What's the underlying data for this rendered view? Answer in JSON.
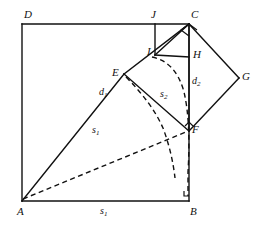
{
  "figure": {
    "kind": "geometry-diagram",
    "width": 262,
    "height": 229,
    "background_color": "#ffffff",
    "stroke_color": "#111111"
  },
  "vertices": [
    {
      "id": "D",
      "label": "D",
      "x": 22,
      "y": 24,
      "label_x": 24,
      "label_y": 9
    },
    {
      "id": "J",
      "label": "J",
      "x": 155,
      "y": 24,
      "label_x": 151,
      "label_y": 9
    },
    {
      "id": "C",
      "label": "C",
      "x": 189,
      "y": 24,
      "label_x": 191,
      "label_y": 9
    },
    {
      "id": "I",
      "label": "I",
      "x": 155,
      "y": 55,
      "label_x": 147,
      "label_y": 46
    },
    {
      "id": "H",
      "label": "H",
      "x": 189,
      "y": 57,
      "label_x": 193,
      "label_y": 49
    },
    {
      "id": "G",
      "label": "G",
      "x": 239,
      "y": 78,
      "label_x": 242,
      "label_y": 71
    },
    {
      "id": "E",
      "label": "E",
      "x": 124,
      "y": 74,
      "label_x": 112,
      "label_y": 67
    },
    {
      "id": "F",
      "label": "F",
      "x": 189,
      "y": 131,
      "label_x": 192,
      "label_y": 124
    },
    {
      "id": "A",
      "label": "A",
      "x": 22,
      "y": 201,
      "label_x": 17,
      "label_y": 206
    },
    {
      "id": "B",
      "label": "B",
      "x": 189,
      "y": 201,
      "label_x": 190,
      "label_y": 206
    }
  ],
  "measures": [
    {
      "id": "d1",
      "base": "d",
      "sub": "1",
      "x": 99,
      "y": 87,
      "meaning": "diagonal-of-large-square"
    },
    {
      "id": "s1_diag",
      "base": "s",
      "sub": "1",
      "x": 92,
      "y": 125,
      "meaning": "side-of-large-square"
    },
    {
      "id": "s2",
      "base": "s",
      "sub": "2",
      "x": 160,
      "y": 89,
      "meaning": "side-of-small-square"
    },
    {
      "id": "d2",
      "base": "d",
      "sub": "2",
      "x": 192,
      "y": 76,
      "meaning": "diagonal-of-small-square"
    },
    {
      "id": "s1_bottom",
      "base": "s",
      "sub": "1",
      "x": 100,
      "y": 206,
      "meaning": "bottom-side-of-large-square"
    }
  ],
  "solid_edges": [
    {
      "name": "edge-D-C",
      "from": "D",
      "to": "C"
    },
    {
      "name": "edge-D-A",
      "from": "D",
      "to": "A"
    },
    {
      "name": "edge-A-B",
      "from": "A",
      "to": "B"
    },
    {
      "name": "edge-B-C",
      "from": "B",
      "to": "C"
    },
    {
      "name": "edge-A-E",
      "from": "A",
      "to": "E"
    },
    {
      "name": "edge-E-C",
      "from": "E",
      "to": "C"
    },
    {
      "name": "edge-E-F",
      "from": "E",
      "to": "F"
    },
    {
      "name": "edge-F-G",
      "from": "F",
      "to": "G"
    },
    {
      "name": "edge-G-C",
      "from": "G",
      "to": "C"
    },
    {
      "name": "edge-C-F",
      "from": "C",
      "to": "F"
    },
    {
      "name": "edge-J-I",
      "from": "J",
      "to": "I"
    },
    {
      "name": "edge-I-H",
      "from": "I",
      "to": "H"
    },
    {
      "name": "edge-I-C",
      "from": "I",
      "to": "C"
    }
  ],
  "dashed_paths": [
    {
      "name": "arc-I-to-B",
      "d": "M 152 57 Q 176 62 184 92 Q 191 122 188 172 L 188 196"
    },
    {
      "name": "arc-E-to-F",
      "d": "M 126 77 Q 152 103 163 128 Q 172 152 175 178"
    },
    {
      "name": "chord-A-to-F",
      "d": "M 23 199 L 186 132"
    }
  ],
  "right_angle_marks": [
    {
      "name": "right-angle-at-C",
      "points": "189,36 181,30 189,24 197,30"
    },
    {
      "name": "right-angle-at-F",
      "points": "185,126 189,122 193,126"
    },
    {
      "name": "right-angle-at-B",
      "points": "184,191 184,196 189,196"
    }
  ]
}
